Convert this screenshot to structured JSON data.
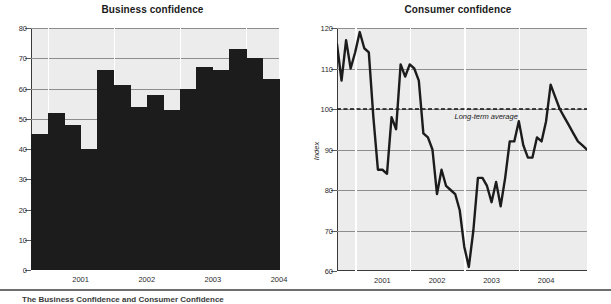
{
  "footer": {
    "caption": "The Business Confidence and Consumer Confidence"
  },
  "charts": [
    {
      "title": "Business confidence",
      "ylabel": "",
      "yticks": [
        "0",
        "10",
        "20",
        "30",
        "40",
        "50",
        "60",
        "70",
        "80"
      ],
      "xticks": [
        "2001",
        "2002",
        "2003",
        "2004"
      ]
    },
    {
      "title": "Consumer confidence",
      "ylabel": "Index",
      "yticks": [
        "60",
        "70",
        "80",
        "90",
        "100",
        "110",
        "120"
      ],
      "xticks": [
        "2001",
        "2002",
        "2003",
        "2004"
      ],
      "annotation": "Long-term average"
    }
  ],
  "chart_data": [
    {
      "type": "bar",
      "title": "Business confidence",
      "xlabel": "",
      "ylabel": "",
      "ylim": [
        0,
        80
      ],
      "ytick_values": [
        0,
        10,
        20,
        30,
        40,
        50,
        60,
        70,
        80
      ],
      "grid": true,
      "legend": "none",
      "bar_color": "#1c1c1c",
      "plot_background": "#ececec",
      "categories": [
        "2000Q4",
        "2001Q1",
        "2001Q2",
        "2001Q3",
        "2001Q4",
        "2002Q1",
        "2002Q2",
        "2002Q3",
        "2002Q4",
        "2003Q1",
        "2003Q2",
        "2003Q3",
        "2003Q4",
        "2004Q1",
        "2004Q2"
      ],
      "values": [
        45,
        52,
        48,
        40,
        66,
        61,
        54,
        58,
        53,
        60,
        67,
        66,
        73,
        70,
        63
      ],
      "x_axis_year_labels": [
        "2001",
        "2002",
        "2003",
        "2004"
      ]
    },
    {
      "type": "line",
      "title": "Consumer confidence",
      "xlabel": "",
      "ylabel": "Index",
      "ylim": [
        60,
        120
      ],
      "ytick_values": [
        60,
        70,
        80,
        90,
        100,
        110,
        120
      ],
      "grid": true,
      "legend": "none",
      "line_color": "#1c1c1c",
      "plot_background": "#ececec",
      "reference_line": {
        "label": "Long-term average",
        "value": 100,
        "style": "dashed"
      },
      "x_axis_year_labels": [
        "2001",
        "2002",
        "2003",
        "2004"
      ],
      "x": [
        0,
        1,
        2,
        3,
        4,
        5,
        6,
        7,
        8,
        9,
        10,
        11,
        12,
        13,
        14,
        15,
        16,
        17,
        18,
        19,
        20,
        21,
        22,
        23,
        24,
        25,
        26,
        27,
        28,
        29,
        30,
        31,
        32,
        33,
        34,
        35,
        36,
        37,
        38,
        39,
        40,
        41,
        42,
        43,
        44,
        45,
        46,
        47,
        48,
        49,
        50,
        51,
        52,
        53,
        54,
        55
      ],
      "values": [
        116,
        107,
        117,
        110,
        114,
        119,
        115,
        114,
        98,
        85,
        85,
        84,
        98,
        95,
        111,
        108,
        111,
        110,
        107,
        94,
        93,
        90,
        79,
        85,
        81,
        80,
        79,
        75,
        66,
        61,
        70,
        83,
        83,
        81,
        77,
        82,
        76,
        83,
        92,
        92,
        97,
        91,
        88,
        88,
        93,
        92,
        97,
        106,
        103,
        100,
        98,
        96,
        94,
        92,
        91,
        90
      ],
      "y_min_observed": 61,
      "y_max_observed": 119
    }
  ]
}
